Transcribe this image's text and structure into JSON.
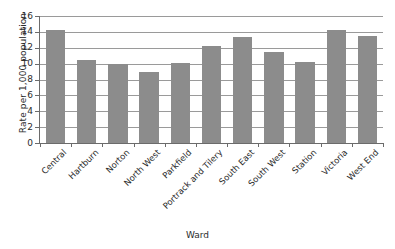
{
  "chart_data": {
    "type": "bar",
    "title": "",
    "xlabel": "Ward",
    "ylabel": "Rate per 1,000 population",
    "categories": [
      "Central",
      "Hartburn",
      "Norton",
      "North West",
      "Parkfield",
      "Portrack and Tilery",
      "South East",
      "South West",
      "Station",
      "Victoria",
      "West End"
    ],
    "values": [
      14.3,
      10.4,
      10.0,
      9.0,
      10.1,
      12.2,
      13.3,
      11.5,
      10.2,
      14.2,
      13.5
    ],
    "ylim": [
      0,
      16
    ],
    "yticks": [
      0,
      2,
      4,
      6,
      8,
      10,
      12,
      14,
      16
    ],
    "ytick_labels": [
      "0",
      "2",
      "4",
      "6",
      "8",
      "10",
      "12",
      "14",
      "16"
    ],
    "grid": true,
    "grid_axis": "y",
    "legend": false,
    "bar_color": "#8c8c8c",
    "axis_color": "#6b6b6b",
    "grid_color": "#9a9a9a",
    "background": "#ffffff"
  }
}
